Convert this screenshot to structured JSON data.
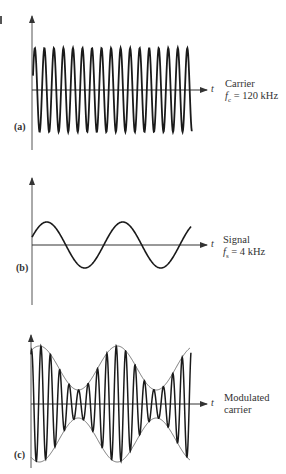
{
  "figure": {
    "panels": [
      {
        "id": "a",
        "tag": "(a)",
        "axis_label": "t",
        "title": "Carrier",
        "param_symbol": "f",
        "param_sub": "c",
        "param_value": "= 120 kHz",
        "cycles": 17
      },
      {
        "id": "b",
        "tag": "(b)",
        "axis_label": "t",
        "title": "Signal",
        "param_symbol": "f",
        "param_sub": "s",
        "param_value": "= 4 kHz",
        "cycles": 2.1
      },
      {
        "id": "c",
        "tag": "(c)",
        "axis_label": "t",
        "title": "Modulated",
        "title2": "carrier",
        "cycles": 17
      }
    ],
    "colors": {
      "ink": "#222222",
      "envelope": "#555555",
      "background": "#ffffff"
    }
  }
}
